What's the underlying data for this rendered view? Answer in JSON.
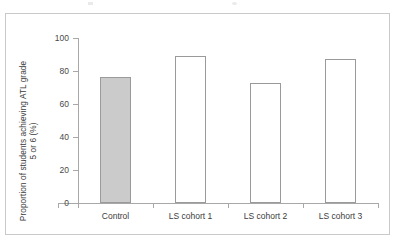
{
  "figure": {
    "frame_border_color": "#c9c9c9",
    "background_color": "#ffffff"
  },
  "chart_data": {
    "type": "bar",
    "title": "",
    "xlabel": "",
    "ylabel": "Proportion of students achieving ATL grade 5 or 6 (%)",
    "ylabel_line1": "Proportion of students achieving ATL grade",
    "ylabel_line2": "5 or 6 (%)",
    "categories": [
      "Control",
      "LS cohort 1",
      "LS cohort 2",
      "LS cohort 3"
    ],
    "values": [
      76.5,
      89.0,
      73.0,
      87.5
    ],
    "ylim": [
      0,
      100
    ],
    "ytick_values": [
      0,
      20,
      40,
      60,
      80,
      100
    ],
    "ytick_labels": [
      "0",
      "20",
      "40",
      "60",
      "80",
      "100"
    ],
    "grid": false,
    "legend": null,
    "bar_styles": [
      {
        "category": "Control",
        "fill": "#cbcbcb",
        "edge": "#9a9a9a",
        "filled": true
      },
      {
        "category": "LS cohort 1",
        "fill": "#ffffff",
        "edge": "#9a9a9a",
        "filled": false
      },
      {
        "category": "LS cohort 2",
        "fill": "#ffffff",
        "edge": "#9a9a9a",
        "filled": false
      },
      {
        "category": "LS cohort 3",
        "fill": "#ffffff",
        "edge": "#9a9a9a",
        "filled": false
      }
    ],
    "axis_color": "#a8a8a8"
  }
}
